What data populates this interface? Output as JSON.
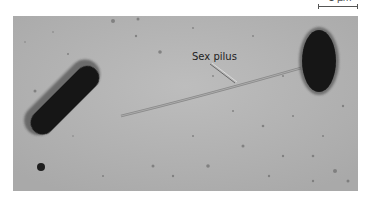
{
  "scale": {
    "label": "1 µm"
  },
  "figure": {
    "label": "Sex pilus",
    "background_color": "#b4b4b4",
    "cell_color": "#151515"
  }
}
